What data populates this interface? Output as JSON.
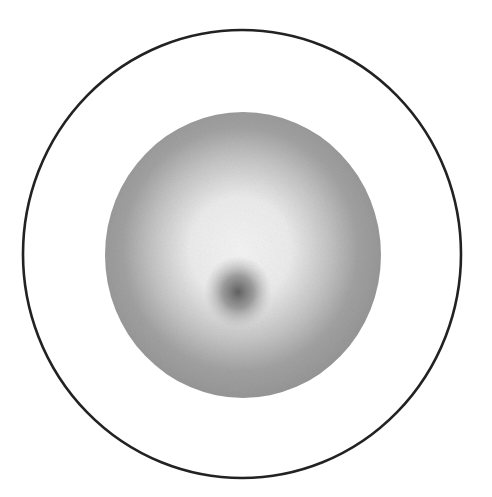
{
  "figure": {
    "colors": {
      "background": "#ffffff",
      "outer_ring_stroke": "#222222",
      "sphere_edge": "#999999",
      "sphere_highlight": "#f2f2f2",
      "dark_spot": "#5e5e5e"
    },
    "outer_ring": {
      "cx": 242,
      "cy": 254,
      "rx": 219,
      "ry": 224,
      "stroke_width": 2.6
    },
    "sphere": {
      "cx": 243,
      "cy": 255,
      "rx": 138,
      "ry": 143
    },
    "dark_spot": {
      "cx": 238,
      "cy": 292,
      "rx": 32,
      "ry": 34
    }
  }
}
